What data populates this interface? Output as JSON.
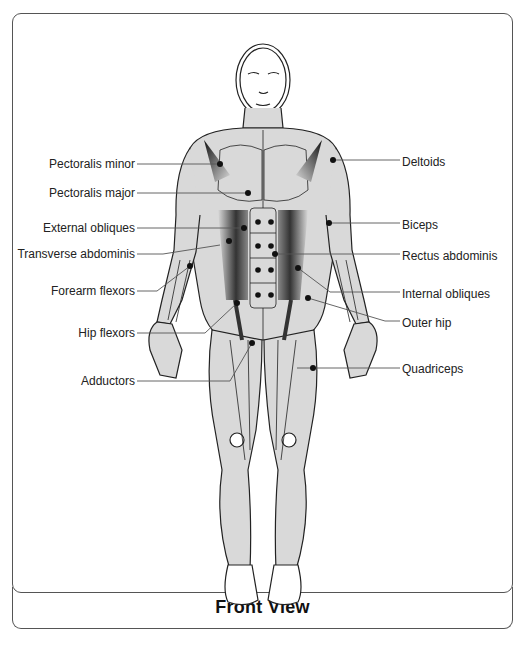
{
  "diagram": {
    "caption": "Front View",
    "colors": {
      "muscle_fill": "#d9d9d9",
      "outline": "#222222",
      "frame": "#555555",
      "text": "#222222"
    },
    "labels_left": [
      {
        "id": "pectoralis-minor",
        "text": "Pectoralis minor",
        "x": 30,
        "y": 157,
        "line": [
          [
            137,
            164
          ],
          [
            220,
            164
          ]
        ],
        "dot": [
          220,
          164
        ]
      },
      {
        "id": "pectoralis-major",
        "text": "Pectoralis major",
        "x": 30,
        "y": 186,
        "line": [
          [
            137,
            193
          ],
          [
            248,
            193
          ]
        ],
        "dot": [
          248,
          193
        ]
      },
      {
        "id": "external-obliques",
        "text": "External obliques",
        "x": 30,
        "y": 221,
        "line": [
          [
            137,
            228
          ],
          [
            244,
            228
          ]
        ],
        "dot": [
          244,
          228
        ]
      },
      {
        "id": "transverse-abdominis",
        "text": "Transverse abdominis",
        "x": 30,
        "y": 247,
        "line": [
          [
            137,
            254
          ],
          [
            163,
            254
          ],
          [
            220,
            245
          ]
        ],
        "dot": [
          229,
          241
        ]
      },
      {
        "id": "forearm-flexors",
        "text": "Forearm flexors",
        "x": 30,
        "y": 284,
        "line": [
          [
            137,
            291
          ],
          [
            157,
            291
          ],
          [
            190,
            266
          ]
        ],
        "dot": [
          190,
          266
        ]
      },
      {
        "id": "hip-flexors",
        "text": "Hip flexors",
        "x": 30,
        "y": 326,
        "line": [
          [
            137,
            333
          ],
          [
            205,
            333
          ],
          [
            237,
            303
          ]
        ],
        "dot": [
          237,
          303
        ]
      },
      {
        "id": "adductors",
        "text": "Adductors",
        "x": 30,
        "y": 374,
        "line": [
          [
            137,
            381
          ],
          [
            230,
            381
          ],
          [
            252,
            343
          ]
        ],
        "dot": [
          252,
          343
        ]
      }
    ],
    "labels_right": [
      {
        "id": "deltoids",
        "text": "Deltoids",
        "x": 402,
        "y": 155,
        "line": [
          [
            333,
            160
          ],
          [
            400,
            160
          ]
        ],
        "dot": [
          333,
          160
        ]
      },
      {
        "id": "biceps",
        "text": "Biceps",
        "x": 402,
        "y": 218,
        "line": [
          [
            329,
            223
          ],
          [
            400,
            223
          ]
        ],
        "dot": [
          329,
          223
        ]
      },
      {
        "id": "rectus-abdominis",
        "text": "Rectus abdominis",
        "x": 402,
        "y": 249,
        "line": [
          [
            275,
            254
          ],
          [
            400,
            254
          ]
        ],
        "dot": [
          275,
          254
        ]
      },
      {
        "id": "internal-obliques",
        "text": "Internal obliques",
        "x": 402,
        "y": 287,
        "line": [
          [
            298,
            268
          ],
          [
            330,
            292
          ],
          [
            400,
            292
          ]
        ],
        "dot": [
          298,
          268
        ]
      },
      {
        "id": "outer-hip",
        "text": "Outer hip",
        "x": 402,
        "y": 316,
        "line": [
          [
            308,
            298
          ],
          [
            385,
            321
          ],
          [
            400,
            321
          ]
        ],
        "dot": [
          308,
          298
        ]
      },
      {
        "id": "quadriceps",
        "text": "Quadriceps",
        "x": 402,
        "y": 362,
        "line": [
          [
            297,
            368
          ],
          [
            400,
            368
          ]
        ],
        "dot": [
          313,
          368
        ]
      }
    ],
    "abs_dots": [
      [
        258,
        222
      ],
      [
        271,
        222
      ],
      [
        258,
        246
      ],
      [
        271,
        246
      ],
      [
        258,
        270
      ],
      [
        271,
        270
      ],
      [
        258,
        295
      ],
      [
        271,
        295
      ]
    ]
  }
}
